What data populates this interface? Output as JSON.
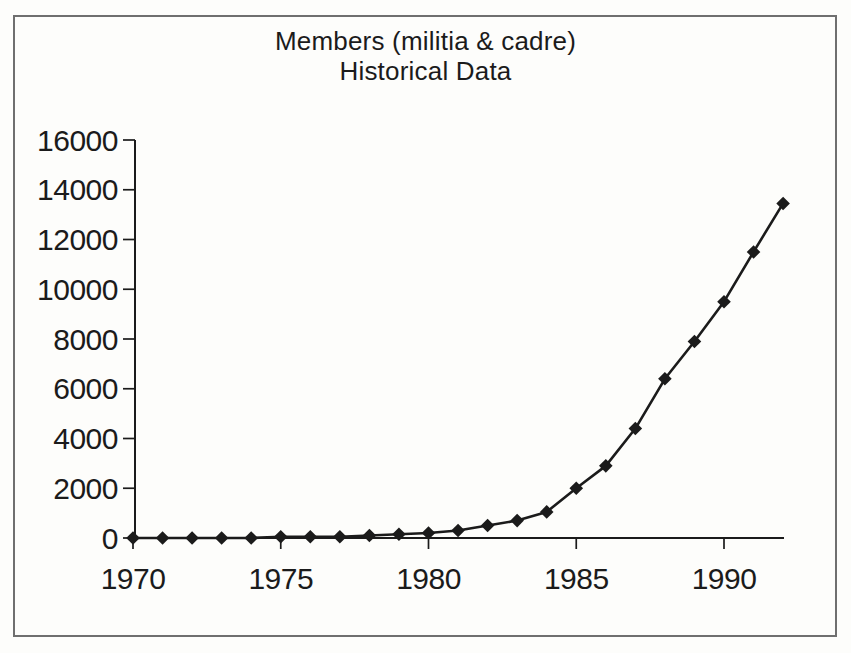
{
  "title": {
    "line1": "Members (militia & cadre)",
    "line2": "Historical Data"
  },
  "chart_data": {
    "type": "line",
    "title": "Members (militia & cadre) Historical Data",
    "xlabel": "",
    "ylabel": "",
    "x": [
      1970,
      1971,
      1972,
      1973,
      1974,
      1975,
      1976,
      1977,
      1978,
      1979,
      1980,
      1981,
      1982,
      1983,
      1984,
      1985,
      1986,
      1987,
      1988,
      1989,
      1990,
      1991,
      1992
    ],
    "series": [
      {
        "name": "Members (militia & cadre)",
        "values": [
          0,
          0,
          0,
          0,
          0,
          50,
          50,
          50,
          100,
          150,
          200,
          300,
          500,
          700,
          1050,
          2000,
          2900,
          4400,
          6400,
          7900,
          9500,
          11500,
          13450
        ]
      }
    ],
    "xticks": [
      1970,
      1975,
      1980,
      1985,
      1990
    ],
    "yticks": [
      0,
      2000,
      4000,
      6000,
      8000,
      10000,
      12000,
      14000,
      16000
    ],
    "xlim": [
      1970,
      1992
    ],
    "ylim": [
      0,
      16000
    ],
    "grid": false,
    "legend": "none",
    "marker": "diamond",
    "line_color": "#1b1b1b"
  },
  "colors": {
    "ink": "#1b1b1b",
    "frame": "#6f6f6f",
    "paper": "#fdfdfb"
  }
}
